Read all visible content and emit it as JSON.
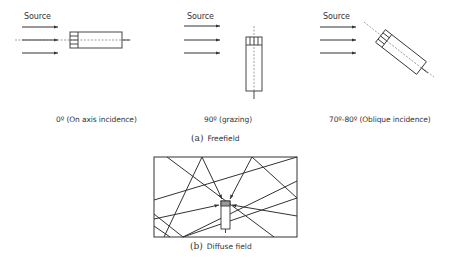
{
  "freefield": {
    "panels": [
      {
        "id": "on-axis",
        "source_label": "Source",
        "caption": "0º (On axis incidence)"
      },
      {
        "id": "grazing",
        "source_label": "Source",
        "caption": "90º (grazing)"
      },
      {
        "id": "oblique",
        "source_label": "Source",
        "caption": "70º-80º (Oblique incidence)"
      }
    ],
    "subcaption": {
      "marker": "(a)",
      "text": "Freefield"
    }
  },
  "diffuse": {
    "subcaption": {
      "marker": "(b)",
      "text": "Diffuse field"
    }
  },
  "colors": {
    "stroke": "#333333",
    "dashed": "#777777",
    "background": "#ffffff"
  }
}
